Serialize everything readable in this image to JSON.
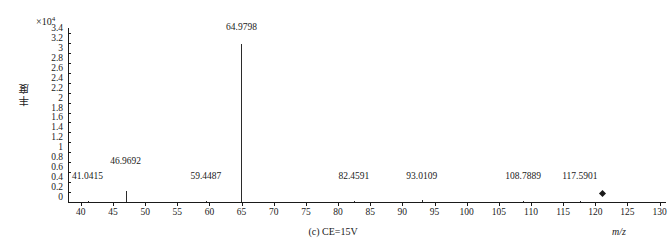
{
  "chart_data": {
    "type": "bar",
    "title": "",
    "caption": "(c) CE=15V",
    "xlabel": "m/z",
    "ylabel": "丰度",
    "y_exponent_prefix": "×10",
    "y_exponent_power": "4",
    "xlim": [
      38,
      131
    ],
    "ylim": [
      0,
      3.5
    ],
    "y_scale_factor": 10000,
    "grid": false,
    "legend": null,
    "xticks": [
      40,
      45,
      50,
      55,
      60,
      65,
      70,
      75,
      80,
      85,
      90,
      95,
      100,
      105,
      110,
      115,
      120,
      125,
      130
    ],
    "yticks": [
      "0",
      "0.2",
      "0.4",
      "0.6",
      "0.8",
      "1",
      "1.2",
      "1.4",
      "1.6",
      "1.8",
      "2",
      "2.2",
      "2.4",
      "2.6",
      "2.8",
      "3",
      "3.2",
      "3.4"
    ],
    "ytick_values": [
      0,
      0.2,
      0.4,
      0.6,
      0.8,
      1.0,
      1.2,
      1.4,
      1.6,
      1.8,
      2.0,
      2.2,
      2.4,
      2.6,
      2.8,
      3.0,
      3.2,
      3.4
    ],
    "peaks": [
      {
        "mz": "41.0415",
        "x": 41.0415,
        "y": 0.03,
        "label_y": 0.42,
        "label_dx": 0
      },
      {
        "mz": "46.9692",
        "x": 46.9692,
        "y": 0.22,
        "label_y": 0.72,
        "label_dx": 0
      },
      {
        "mz": "59.4487",
        "x": 59.4487,
        "y": 0.03,
        "label_y": 0.42,
        "label_dx": 0
      },
      {
        "mz": "64.9798",
        "x": 64.9798,
        "y": 3.18,
        "label_y": 3.42,
        "label_dx": 0
      },
      {
        "mz": "82.4591",
        "x": 82.4591,
        "y": 0.03,
        "label_y": 0.42,
        "label_dx": 0
      },
      {
        "mz": "93.0109",
        "x": 93.0109,
        "y": 0.05,
        "label_y": 0.42,
        "label_dx": 0
      },
      {
        "mz": "108.7889",
        "x": 108.7889,
        "y": 0.03,
        "label_y": 0.42,
        "label_dx": 0
      },
      {
        "mz": "117.5901",
        "x": 117.5901,
        "y": 0.03,
        "label_y": 0.42,
        "label_dx": 0
      }
    ],
    "markers": [
      {
        "x": 121.1,
        "y": 0.18,
        "shape": "diamond"
      }
    ]
  }
}
